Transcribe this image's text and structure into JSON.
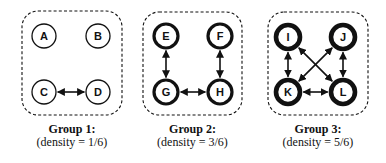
{
  "colors": {
    "stroke": "#111111",
    "background": "#ffffff"
  },
  "groups": [
    {
      "title": "Group 1:",
      "density": "(density = 1/6)",
      "node_stroke_width": 1.3,
      "box": {
        "x": 22,
        "y": 11,
        "w": 100,
        "h": 104
      },
      "nodes": [
        {
          "id": "A",
          "x": 44,
          "y": 36
        },
        {
          "id": "B",
          "x": 98,
          "y": 36
        },
        {
          "id": "C",
          "x": 44,
          "y": 92
        },
        {
          "id": "D",
          "x": 98,
          "y": 92
        }
      ],
      "edges": [
        [
          "C",
          "D"
        ]
      ]
    },
    {
      "title": "Group 2:",
      "density": "(density = 3/6)",
      "node_stroke_width": 3.2,
      "box": {
        "x": 143,
        "y": 12,
        "w": 99,
        "h": 103
      },
      "nodes": [
        {
          "id": "E",
          "x": 166,
          "y": 36
        },
        {
          "id": "F",
          "x": 220,
          "y": 36
        },
        {
          "id": "G",
          "x": 166,
          "y": 92
        },
        {
          "id": "H",
          "x": 220,
          "y": 92
        }
      ],
      "edges": [
        [
          "E",
          "G"
        ],
        [
          "F",
          "H"
        ],
        [
          "G",
          "H"
        ]
      ]
    },
    {
      "title": "Group 3:",
      "density": "(density = 5/6)",
      "node_stroke_width": 4.6,
      "box": {
        "x": 268,
        "y": 12,
        "w": 100,
        "h": 103
      },
      "nodes": [
        {
          "id": "I",
          "x": 288,
          "y": 37
        },
        {
          "id": "J",
          "x": 343,
          "y": 37
        },
        {
          "id": "K",
          "x": 288,
          "y": 92
        },
        {
          "id": "L",
          "x": 343,
          "y": 92
        }
      ],
      "edges": [
        [
          "I",
          "K"
        ],
        [
          "J",
          "L"
        ],
        [
          "K",
          "L"
        ],
        [
          "I",
          "L"
        ],
        [
          "J",
          "K"
        ]
      ]
    }
  ]
}
